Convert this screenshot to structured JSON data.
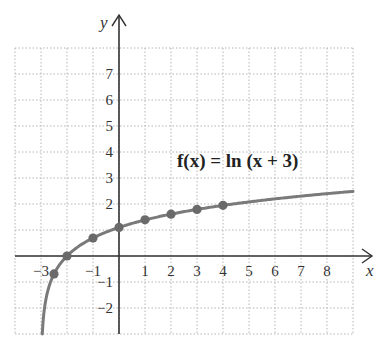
{
  "chart_data": {
    "type": "line",
    "title": "",
    "annotation": "f(x) = ln (x + 3)",
    "function": "ln(x + 3)",
    "xlabel": "x",
    "ylabel": "y",
    "xlim": [
      -4,
      9
    ],
    "ylim": [
      -3,
      8
    ],
    "grid": true,
    "x_ticks": [
      "-3",
      "-1",
      "1",
      "2",
      "3",
      "4",
      "5",
      "6",
      "7",
      "8"
    ],
    "y_ticks": [
      "-2",
      "-1",
      "2",
      "3",
      "4",
      "5",
      "6",
      "7"
    ],
    "series": [
      {
        "name": "f(x) = ln (x + 3)",
        "curve_domain": [
          -2.95,
          9
        ],
        "points": [
          {
            "x": -2.5,
            "y": -0.69
          },
          {
            "x": -2,
            "y": 0
          },
          {
            "x": -1,
            "y": 0.69
          },
          {
            "x": 0,
            "y": 1.1
          },
          {
            "x": 1,
            "y": 1.39
          },
          {
            "x": 2,
            "y": 1.61
          },
          {
            "x": 3,
            "y": 1.79
          },
          {
            "x": 4,
            "y": 1.95
          }
        ]
      }
    ],
    "colors": {
      "curve": "#7a7a7a",
      "points": "#6a6a6a",
      "axes": "#333333",
      "grid": "#b5b5b5"
    }
  }
}
